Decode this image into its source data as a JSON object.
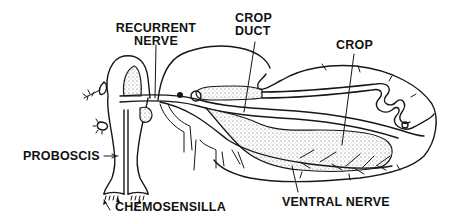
{
  "diagram": {
    "labels": {
      "recurrent_nerve_line1": "RECURRENT",
      "recurrent_nerve_line2": "NERVE",
      "crop_duct_line1": "CROP",
      "crop_duct_line2": "DUCT",
      "crop": "CROP",
      "proboscis": "PROBOSCIS",
      "chemosensilla": "CHEMOSENSILLA",
      "ventral_nerve": "VENTRAL NERVE"
    },
    "colors": {
      "ink": "#161616",
      "background": "#ffffff"
    }
  }
}
